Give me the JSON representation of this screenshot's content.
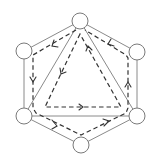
{
  "diagram": {
    "type": "graph",
    "colors": {
      "edge": "#8a8a8a",
      "node_stroke": "#7a7a7a",
      "node_fill": "#ffffff",
      "dashed_path": "#333333"
    },
    "nodes": [
      {
        "id": "top",
        "cx": 80,
        "cy": 21,
        "r": 8
      },
      {
        "id": "upper-left",
        "cx": 24,
        "cy": 51,
        "r": 8
      },
      {
        "id": "upper-right",
        "cx": 137,
        "cy": 52,
        "r": 8
      },
      {
        "id": "lower-left",
        "cx": 24,
        "cy": 116,
        "r": 8
      },
      {
        "id": "lower-right",
        "cx": 137,
        "cy": 116,
        "r": 8
      },
      {
        "id": "bottom",
        "cx": 81,
        "cy": 145,
        "r": 8
      }
    ],
    "solid_edges": [
      [
        "top",
        "upper-left"
      ],
      [
        "upper-left",
        "lower-left"
      ],
      [
        "lower-left",
        "bottom"
      ],
      [
        "bottom",
        "lower-right"
      ],
      [
        "lower-right",
        "upper-right"
      ],
      [
        "upper-right",
        "top"
      ],
      [
        "top",
        "lower-left"
      ],
      [
        "lower-left",
        "lower-right"
      ],
      [
        "lower-right",
        "top"
      ]
    ],
    "dashed_loops": [
      {
        "name": "outer-loop",
        "direction": "counter-clockwise"
      },
      {
        "name": "inner-triangle-loop",
        "direction": "counter-clockwise"
      }
    ]
  }
}
